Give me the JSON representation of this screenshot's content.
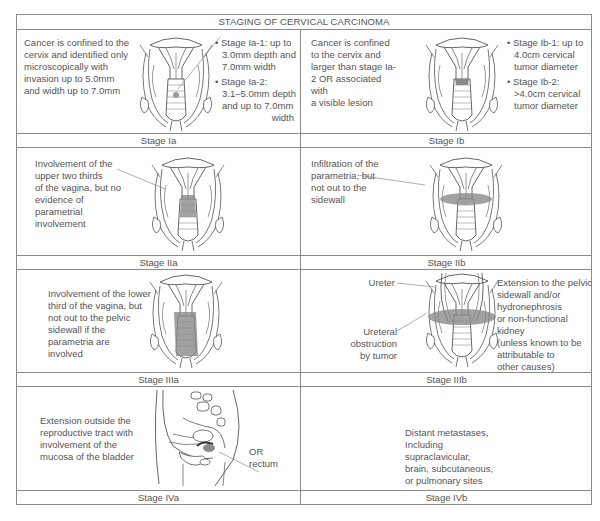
{
  "title": "STAGING OF CERVICAL CARCINOMA",
  "stages": {
    "Ia": {
      "label": "Stage Ia",
      "description": [
        "Cancer is confined to the",
        "cervix and identified only",
        "microscopically with",
        "invasion up to 5.0mm",
        "and width up to 7.0mm"
      ],
      "bullets": [
        {
          "lines": [
            "Stage Ia-1: up to",
            "3.0mm depth and",
            "7.0mm width"
          ]
        },
        {
          "lines": [
            "Stage Ia-2:",
            "3.1–5.0mm depth",
            "and up to 7.0mm",
            "width"
          ]
        }
      ]
    },
    "Ib": {
      "label": "Stage Ib",
      "description": [
        "Cancer is confined",
        "to the cervix and",
        "larger than stage Ia-",
        "2 OR associated",
        "with",
        "a visible lesion"
      ],
      "bullets": [
        {
          "lines": [
            "Stage Ib-1: up to",
            "4.0cm cervical",
            "tumor diameter"
          ]
        },
        {
          "lines": [
            "Stage Ib-2:",
            ">4.0cm cervical",
            "tumor diameter"
          ]
        }
      ]
    },
    "IIa": {
      "label": "Stage IIa",
      "description": [
        "Involvement of the",
        "upper two thirds",
        "of the vagina, but no",
        "evidence of",
        "parametrial",
        "involvement"
      ]
    },
    "IIb": {
      "label": "Stage IIb",
      "description": [
        "Infiltration of the",
        "parametria, but",
        "not out to the",
        "sidewall"
      ]
    },
    "IIIa": {
      "label": "Stage IIIa",
      "description": [
        "Involvement of the lower",
        "third of the vagina, but",
        "not out to the pelvic",
        "sidewall if the",
        "parametria are",
        "involved"
      ]
    },
    "IIIb": {
      "label": "Stage IIIb",
      "callouts": {
        "ureter": "Ureter",
        "obstruction": [
          "Ureteral",
          "obstruction",
          "by tumor"
        ]
      },
      "description": [
        "Extension to the pelvic",
        "sidewall and/or",
        "hydronephrosis",
        "or non-functional kidney",
        "(unless known to be",
        "attributable to",
        "other causes)"
      ]
    },
    "IVa": {
      "label": "Stage IVa",
      "description": [
        "Extension outside the",
        "reproductive tract with",
        "involvement of the",
        "mucosa of the bladder"
      ],
      "callout": [
        "OR",
        "rectum"
      ]
    },
    "IVb": {
      "label": "Stage IVb",
      "description": [
        "Distant metastases,",
        "Including",
        "supraclavicular,",
        "brain, subcutaneous,",
        "or pulmonary sites"
      ]
    }
  },
  "colors": {
    "border": "#8a8a8a",
    "text": "#555555",
    "tumor_shade": "#9a9a9a"
  }
}
